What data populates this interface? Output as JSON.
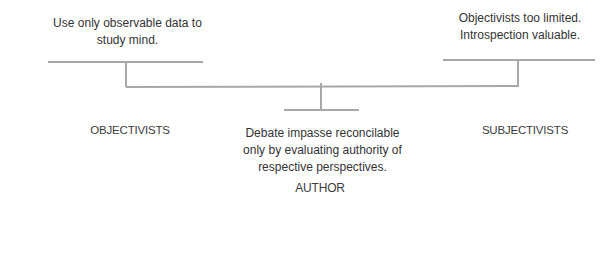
{
  "diagram": {
    "left": {
      "claim": "Use only observable data to study mind.",
      "claim_lines": [
        "Use only observable data to",
        "study mind."
      ],
      "label": "OBJECTIVISTS"
    },
    "right": {
      "claim": "Objectivists too limited. Introspection valuable.",
      "claim_lines": [
        "Objectivists too limited.",
        "Introspection valuable."
      ],
      "label": "SUBJECTIVISTS"
    },
    "center": {
      "claim": "Debate impasse reconcilable only by evaluating authority of respective perspectives.",
      "claim_lines": [
        "Debate impasse reconcilable",
        "only by evaluating authority of",
        "respective perspectives."
      ],
      "label": "AUTHOR"
    },
    "colors": {
      "line": "#a8a8a8",
      "text": "#333333"
    }
  }
}
